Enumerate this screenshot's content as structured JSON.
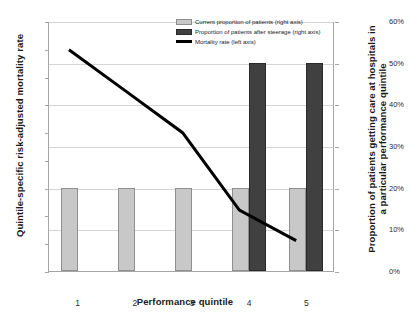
{
  "chart_data": {
    "type": "bar",
    "title": "",
    "xlabel": "Performance quintile",
    "categories": [
      "1",
      "2",
      "3",
      "4",
      "5"
    ],
    "grid": true,
    "legend_position": "top-center",
    "axes": {
      "left": {
        "label": "Quintile-specific risk-adjusted mortality rate",
        "ylim": [
          0,
          9
        ],
        "ticks": [
          "0%",
          "1%",
          "2%",
          "3%",
          "4%",
          "5%",
          "6%",
          "7%",
          "8%",
          "9%"
        ],
        "tick_values": [
          0,
          1,
          2,
          3,
          4,
          5,
          6,
          7,
          8,
          9
        ]
      },
      "right": {
        "label": "Proportion of patients getting care at hospitals in a particular performance quintile",
        "ylim": [
          0,
          60
        ],
        "ticks": [
          "0%",
          "10%",
          "20%",
          "30%",
          "40%",
          "50%",
          "60%"
        ],
        "tick_values": [
          0,
          10,
          20,
          30,
          40,
          50,
          60
        ]
      }
    },
    "series": [
      {
        "name": "Current proportion of patients (right axis)",
        "type": "bar",
        "axis": "right",
        "color": "#c8c8c8",
        "values": [
          20,
          20,
          20,
          20,
          20
        ]
      },
      {
        "name": "Proportion of patients after steerage (right axis)",
        "type": "bar",
        "axis": "right",
        "color": "#404040",
        "values": [
          0,
          0,
          0,
          50,
          50
        ]
      },
      {
        "name": "Mortality rate (left axis)",
        "type": "line",
        "axis": "left",
        "color": "#000000",
        "values": [
          8.0,
          6.5,
          5.0,
          2.2,
          1.1
        ]
      }
    ]
  },
  "legend": {
    "items": [
      {
        "label": "Current proportion of patients (right axis)"
      },
      {
        "label": "Proportion of patients after steerage (right axis)"
      },
      {
        "label": "Mortality rate (left axis)"
      }
    ]
  }
}
